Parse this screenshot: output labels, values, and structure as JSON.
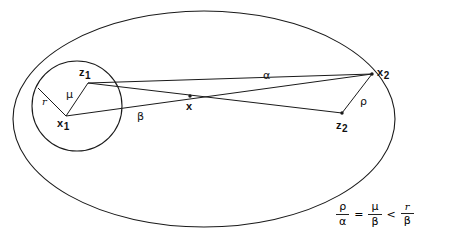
{
  "figure": {
    "stroke_color": "#1a1a1a",
    "background": "#ffffff",
    "outer_region": {
      "shape": "ellipse",
      "cx": 204,
      "cy": 119,
      "rx": 191,
      "ry": 108
    },
    "inner_region": {
      "shape": "circle",
      "cx": 77,
      "cy": 106,
      "r": 45
    },
    "points": [
      {
        "id": "x",
        "label": "x",
        "sub": "",
        "x": 190,
        "y": 96,
        "dot": true,
        "label_x": 186,
        "label_y": 101
      },
      {
        "id": "x1",
        "label": "x",
        "sub": "1",
        "x": 66,
        "y": 116,
        "dot": false,
        "label_x": 57,
        "label_y": 118
      },
      {
        "id": "x2",
        "label": "x",
        "sub": "2",
        "x": 372,
        "y": 74,
        "dot": true,
        "label_x": 377,
        "label_y": 67
      },
      {
        "id": "z1",
        "label": "z",
        "sub": "1",
        "x": 88,
        "y": 83,
        "dot": false,
        "label_x": 79,
        "label_y": 67
      },
      {
        "id": "z2",
        "label": "z",
        "sub": "2",
        "x": 342,
        "y": 113,
        "dot": true,
        "label_x": 336,
        "label_y": 120
      }
    ],
    "segments": [
      {
        "id": "radius",
        "from": "x1_edge",
        "to": "x1",
        "x1": 38,
        "y1": 88,
        "x2": 66,
        "y2": 116
      },
      {
        "id": "mu",
        "from": "x1",
        "to": "z1",
        "x1": 66,
        "y1": 116,
        "x2": 88,
        "y2": 83
      },
      {
        "id": "beta",
        "from": "x1",
        "to": "x2",
        "x1": 66,
        "y1": 116,
        "x2": 372,
        "y2": 74
      },
      {
        "id": "alpha",
        "from": "z1",
        "to": "x2",
        "x1": 88,
        "y1": 83,
        "x2": 372,
        "y2": 74
      },
      {
        "id": "z1z2",
        "from": "z1",
        "to": "z2",
        "x1": 88,
        "y1": 83,
        "x2": 342,
        "y2": 113
      },
      {
        "id": "rho",
        "from": "z2",
        "to": "x2",
        "x1": 342,
        "y1": 113,
        "x2": 372,
        "y2": 74
      }
    ],
    "length_labels": [
      {
        "id": "r",
        "text": "r",
        "style": "italic",
        "x": 42,
        "y": 97
      },
      {
        "id": "mu",
        "text": "μ",
        "style": "greek",
        "x": 66,
        "y": 89
      },
      {
        "id": "beta",
        "text": "β",
        "style": "greek",
        "x": 137,
        "y": 111
      },
      {
        "id": "alpha",
        "text": "α",
        "style": "greek",
        "x": 263,
        "y": 70
      },
      {
        "id": "rho",
        "text": "ρ",
        "style": "greek",
        "x": 360,
        "y": 96
      }
    ]
  },
  "formula": {
    "term1": {
      "numerator": "ρ",
      "denominator": "α"
    },
    "operator1": "=",
    "term2": {
      "numerator": "μ",
      "denominator": "β"
    },
    "operator2": "<",
    "term3": {
      "numerator": "r",
      "denominator": "β"
    }
  }
}
